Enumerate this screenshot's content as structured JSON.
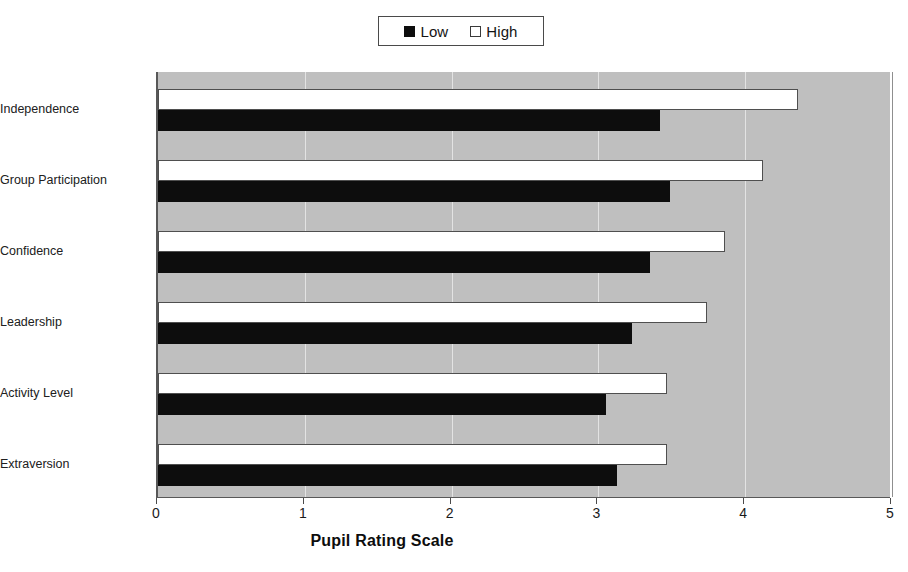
{
  "legend": {
    "position": "top-center",
    "entries": [
      {
        "label": "Low",
        "swatch": "filled-square-icon",
        "color": "#0d0d0d"
      },
      {
        "label": "High",
        "swatch": "empty-square-icon",
        "color": "#ffffff"
      }
    ]
  },
  "axis": {
    "x_title": "Pupil Rating Scale",
    "x_ticks": [
      "0",
      "1",
      "2",
      "3",
      "4",
      "5"
    ]
  },
  "colors": {
    "plot_background": "#bfbfbf",
    "low_series": "#0d0d0d",
    "high_series": "#ffffff",
    "axis": "#585858",
    "gridline": "#e3e3e3"
  },
  "chart_data": {
    "type": "bar",
    "orientation": "horizontal",
    "title": "",
    "subtitle": "",
    "xlabel": "Pupil Rating Scale",
    "ylabel": "",
    "xlim": [
      0,
      5
    ],
    "xticks": [
      0,
      1,
      2,
      3,
      4,
      5
    ],
    "grid": true,
    "legend": [
      "Low",
      "High"
    ],
    "legend_position": "top-center",
    "categories": [
      "Independence",
      "Group Participation",
      "Confidence",
      "Leadership",
      "Activity Level",
      "Extraversion"
    ],
    "series": [
      {
        "name": "High",
        "values": [
          4.36,
          4.12,
          3.86,
          3.74,
          3.47,
          3.47
        ]
      },
      {
        "name": "Low",
        "values": [
          3.42,
          3.49,
          3.35,
          3.23,
          3.05,
          3.13
        ]
      }
    ]
  }
}
